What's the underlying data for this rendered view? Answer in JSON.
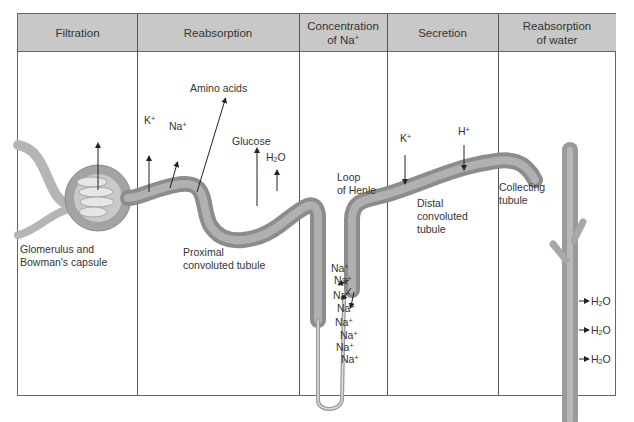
{
  "figure": {
    "columns": [
      {
        "id": "filtration",
        "title": "Filtration",
        "x": 0,
        "w": 119
      },
      {
        "id": "reabsorption",
        "title": "Reabsorption",
        "x": 119,
        "w": 162
      },
      {
        "id": "concentration",
        "title": "Concentration of Na",
        "sup": "+",
        "x": 281,
        "w": 88
      },
      {
        "id": "secretion",
        "title": "Secretion",
        "x": 369,
        "w": 111
      },
      {
        "id": "reabsorption-water",
        "title": "Reabsorption of water",
        "x": 480,
        "w": 119
      }
    ],
    "structures": {
      "glomerulus": "Glomerulus and Bowman's capsule",
      "glomerulus_l1": "Glomerulus and",
      "glomerulus_l2": "Bowman's capsule",
      "proximal_l1": "Proximal",
      "proximal_l2": "convoluted tubule",
      "loop_l1": "Loop",
      "loop_l2": "of Henle",
      "distal_l1": "Distal",
      "distal_l2": "convoluted",
      "distal_l3": "tubule",
      "collecting_l1": "Collecting",
      "collecting_l2": "tubule"
    },
    "substances": {
      "k": "K",
      "na": "Na",
      "h": "H",
      "plus": "+",
      "amino": "Amino acids",
      "glucose": "Glucose",
      "h2o_h": "H",
      "h2o_2": "2",
      "h2o_o": "O"
    },
    "na_loop_labels": [
      "Na",
      "Na",
      "Na",
      "Na",
      "Na",
      "Na",
      "Na",
      "Na"
    ],
    "water_outputs": [
      "H2O",
      "H2O",
      "H2O"
    ],
    "colors": {
      "header_bg": "#c8c8c8",
      "tubule": "#9a9a9a",
      "tubule_light": "#b8b8b8",
      "border": "#555555"
    }
  }
}
